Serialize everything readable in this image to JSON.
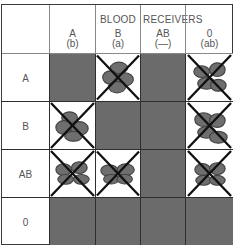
{
  "title": {
    "left": "BLOOD",
    "right": "RECEIVERS"
  },
  "columns": [
    {
      "type": "A",
      "antibody": "(b)"
    },
    {
      "type": "B",
      "antibody": "(a)"
    },
    {
      "type": "AB",
      "antibody": "(—)"
    },
    {
      "type": "0",
      "antibody": "(ab)"
    }
  ],
  "rows": [
    {
      "label": "A",
      "cells": [
        "compatible",
        "agglutinated",
        "compatible",
        "agglutinated"
      ]
    },
    {
      "label": "B",
      "cells": [
        "agglutinated",
        "compatible",
        "compatible",
        "agglutinated"
      ]
    },
    {
      "label": "AB",
      "cells": [
        "agglutinated",
        "agglutinated",
        "compatible",
        "agglutinated"
      ]
    },
    {
      "label": "0",
      "cells": [
        "compatible",
        "compatible",
        "compatible",
        "compatible"
      ]
    }
  ],
  "legend_colors": {
    "compatible": "#6b6b6b",
    "agglutinated_bg": "#ffffff",
    "cross": "#111111"
  }
}
